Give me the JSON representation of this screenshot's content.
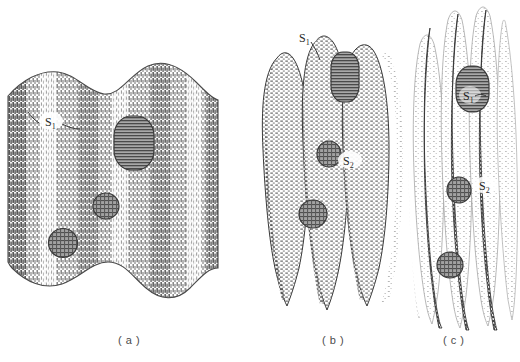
{
  "figure": {
    "background_color": "#ffffff",
    "ink_color": "#3a3a3a",
    "inclusion_fill": "#8d8d8d",
    "inclusion_stroke": "#3a3a3a"
  },
  "panels": [
    {
      "id": "a",
      "caption": "( a )",
      "description": "Broad shallow sinusoidal corrugation, vertical line hatching",
      "fold_count": 3,
      "labels": [
        {
          "text": "S",
          "sub": "1",
          "x": 46,
          "y": 122
        }
      ],
      "inclusions": [
        {
          "shape": "rounded-rect",
          "cx": 134,
          "cy": 143,
          "rx": 20,
          "ry": 27,
          "texture": "horizontal-lines"
        },
        {
          "shape": "circle",
          "cx": 106,
          "cy": 206,
          "rx": 13,
          "ry": 13,
          "texture": "cross-hatch"
        },
        {
          "shape": "circle",
          "cx": 63,
          "cy": 243,
          "rx": 14,
          "ry": 15,
          "texture": "cross-hatch"
        }
      ]
    },
    {
      "id": "b",
      "caption": "( b )",
      "description": "Deeply folded ridges, partially compressed, dashed stipple hatching",
      "fold_count": 4,
      "labels": [
        {
          "text": "S",
          "sub": "1",
          "x": 302,
          "y": 79
        },
        {
          "text": "S",
          "sub": "2",
          "x": 347,
          "y": 200
        }
      ],
      "inclusions": [
        {
          "shape": "rounded-rect",
          "cx": 345,
          "cy": 117,
          "rx": 14,
          "ry": 25,
          "texture": "horizontal-lines"
        },
        {
          "shape": "circle",
          "cx": 329,
          "cy": 194,
          "rx": 12,
          "ry": 13,
          "texture": "cross-hatch"
        },
        {
          "shape": "circle",
          "cx": 313,
          "cy": 254,
          "rx": 14,
          "ry": 14,
          "texture": "cross-hatch"
        }
      ]
    },
    {
      "id": "c",
      "caption": "( c )",
      "description": "Fully compressed narrow vertical lamellae, dashed stipple hatching",
      "fold_count": 5,
      "labels": [
        {
          "text": "S",
          "sub": "1",
          "x": 464,
          "y": 99
        },
        {
          "text": "S",
          "sub": "2",
          "x": 479,
          "y": 186
        }
      ],
      "inclusions": [
        {
          "shape": "rounded-rect",
          "cx": 472,
          "cy": 94,
          "rx": 17,
          "ry": 22,
          "texture": "horizontal-lines"
        },
        {
          "shape": "circle",
          "cx": 459,
          "cy": 190,
          "rx": 12,
          "ry": 13,
          "texture": "cross-hatch"
        },
        {
          "shape": "circle",
          "cx": 450,
          "cy": 265,
          "rx": 13,
          "ry": 13,
          "texture": "cross-hatch"
        }
      ]
    }
  ],
  "captions": {
    "a": "( a )",
    "b": "( b )",
    "c": "( c )"
  },
  "labels_flat": {
    "s1": "S",
    "s1_sub": "1",
    "s2": "S",
    "s2_sub": "2"
  }
}
